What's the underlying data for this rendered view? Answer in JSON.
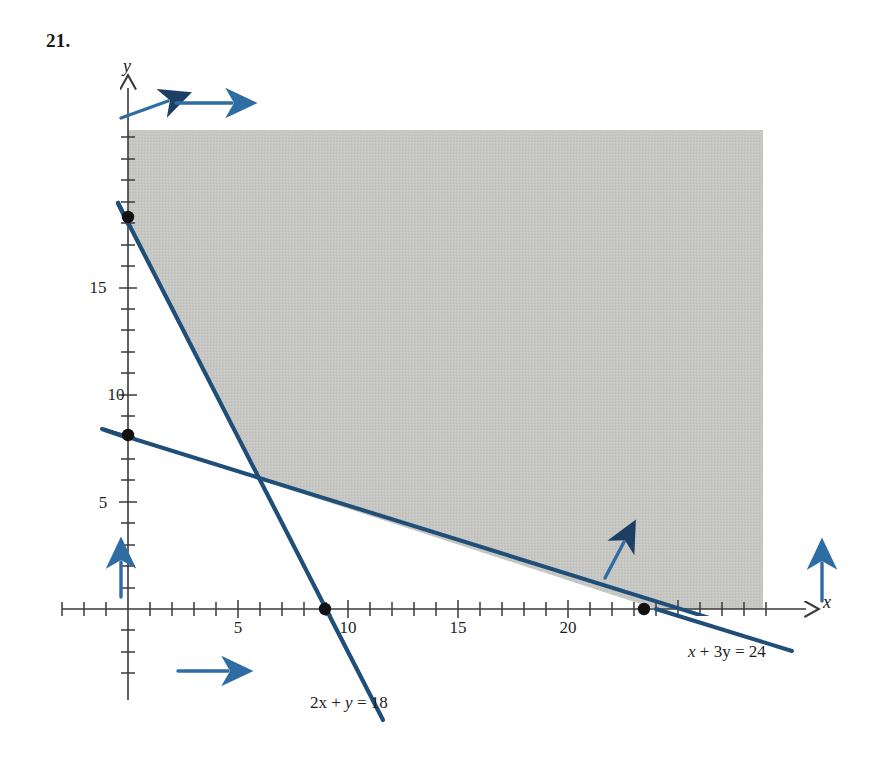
{
  "figure": {
    "problem_number": "21."
  },
  "axes": {
    "x_axis_name": "x",
    "y_axis_name": "y",
    "x_tick_labels": [
      "5",
      "10",
      "15",
      "20"
    ],
    "y_tick_labels": [
      "5",
      "10",
      "15"
    ]
  },
  "labels": {
    "line1_equation": "2x + y = 18",
    "line2_equation": "x + 3y = 24"
  },
  "colors": {
    "line_blue": "#1f4e79",
    "arrow_blue": "#2e6da4",
    "shade_gray": "#c3c3c0",
    "axis_black": "#3a3a3a",
    "text_black": "#1a1a1a"
  },
  "chart_data": {
    "type": "line",
    "xlabel": "x",
    "ylabel": "y",
    "xlim": [
      -1.2,
      26.5
    ],
    "ylim": [
      -2.5,
      21.0
    ],
    "grid": false,
    "legend": "none",
    "x_ticks_major": [
      5,
      10,
      15,
      20
    ],
    "y_ticks_major": [
      5,
      10,
      15
    ],
    "tick_step_minor": 1,
    "series": [
      {
        "name": "2x + y = 18",
        "equation": "2x + y = 18",
        "slope": -2,
        "intercept": 18,
        "x_intercept": 9,
        "y_intercept": 18,
        "draw_from": [
          -0.45,
          18.9
        ],
        "draw_to": [
          11.6,
          -5.2
        ],
        "label": "2x + y = 18",
        "color": "#1f4e79"
      },
      {
        "name": "x + 3y = 24",
        "equation": "x + 3y = 24",
        "slope": -0.3333,
        "intercept": 8,
        "x_intercept": 24,
        "y_intercept": 8,
        "draw_from": [
          -1.15,
          8.4
        ],
        "draw_to": [
          26.2,
          -0.73
        ],
        "label": "x + 3y = 24",
        "color": "#1f4e79"
      }
    ],
    "points": [
      {
        "x": 0,
        "y": 18,
        "marker": "filled-circle",
        "note": "y-intercept of 2x + y = 18"
      },
      {
        "x": 0,
        "y": 8,
        "marker": "filled-circle",
        "note": "y-intercept of x + 3y = 24"
      },
      {
        "x": 9,
        "y": 0,
        "marker": "filled-circle",
        "note": "x-intercept of 2x + y = 18"
      },
      {
        "x": 24,
        "y": 0,
        "marker": "filled-circle",
        "note": "x-intercept of x + 3y = 24"
      }
    ],
    "vertices": [
      {
        "x": 0,
        "y": 18
      },
      {
        "x": 6,
        "y": 6
      },
      {
        "x": 24,
        "y": 0
      }
    ],
    "shaded_region": {
      "fill": "#c3c3c0",
      "description": "Feasible region: intersection of 2x + y >= 18, x + 3y >= 24, x >= 0, y >= 0; unbounded to the upper right",
      "polygon_clipped": [
        [
          0,
          20.1
        ],
        [
          0,
          18
        ],
        [
          6,
          6
        ],
        [
          24,
          0
        ],
        [
          25.8,
          0
        ],
        [
          25.8,
          20.1
        ]
      ]
    },
    "direction_arrows": [
      {
        "at": [
          0.45,
          19.2
        ],
        "direction": "up-right",
        "note": "half-plane 2x + y >= 18"
      },
      {
        "at": [
          2.6,
          19.7
        ],
        "direction": "right",
        "note": "half-plane 2x + y >= 18"
      },
      {
        "at": [
          0.0,
          2.2
        ],
        "direction": "up",
        "note": "half-plane y >= 0 / x >= 0 boundary"
      },
      {
        "at": [
          2.5,
          -2.8
        ],
        "direction": "right",
        "note": "half-plane x >= 0"
      },
      {
        "at": [
          22.2,
          2.4
        ],
        "direction": "up-right",
        "note": "half-plane x + 3y >= 24"
      },
      {
        "at": [
          25.6,
          1.6
        ],
        "direction": "up",
        "note": "half-plane x + 3y >= 24"
      }
    ]
  }
}
